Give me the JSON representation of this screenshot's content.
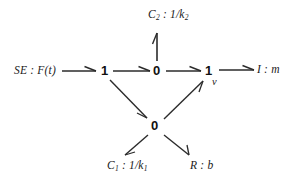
{
  "diagram": {
    "stroke_color": "#2b2b2b",
    "text_color": "#1a1a1a",
    "background": "#ffffff",
    "nodes": {
      "junction_one_left": "1",
      "junction_zero_middle": "0",
      "junction_one_right": "1",
      "junction_zero_bottom": "0"
    },
    "elements": {
      "source_effort": "SE : F(t)",
      "capacitor_top": "C",
      "capacitor_top_sub": "2",
      "capacitor_top_value": " : 1/k",
      "capacitor_top_value_sub": "2",
      "inertia_right": "I : m",
      "capacitor_bottom": "C",
      "capacitor_bottom_sub": "1",
      "capacitor_bottom_value": " : 1/k",
      "capacitor_bottom_value_sub": "1",
      "resistor_bottom": "R : b"
    },
    "flow_labels": {
      "velocity": "v"
    },
    "bonds": [
      {
        "name": "se-to-one-left",
        "from": "SE : F(t)",
        "to": "1",
        "direction": "right"
      },
      {
        "name": "one-left-to-zero-middle",
        "from": "1",
        "to": "0",
        "direction": "right"
      },
      {
        "name": "zero-middle-to-c2",
        "from": "0",
        "to": "C2 : 1/k2",
        "direction": "up"
      },
      {
        "name": "zero-middle-to-one-right",
        "from": "0",
        "to": "1",
        "direction": "right"
      },
      {
        "name": "one-right-to-inertia",
        "from": "1",
        "to": "I : m",
        "direction": "right"
      },
      {
        "name": "one-left-to-zero-bottom",
        "from": "1",
        "to": "0",
        "direction": "down-right"
      },
      {
        "name": "zero-bottom-to-one-right",
        "from": "0",
        "to": "1",
        "direction": "up-right"
      },
      {
        "name": "zero-bottom-to-c1",
        "from": "0",
        "to": "C1 : 1/k1",
        "direction": "down-left"
      },
      {
        "name": "zero-bottom-to-resistor",
        "from": "0",
        "to": "R : b",
        "direction": "down-right"
      }
    ]
  }
}
